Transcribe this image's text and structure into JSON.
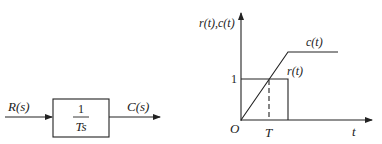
{
  "block_diagram": {
    "input_label": "R(s)",
    "output_label": "C(s)",
    "transfer_function": {
      "numerator": "1",
      "denominator": "Ts"
    }
  },
  "graph": {
    "y_axis_label": "r(t),c(t)",
    "x_axis_label": "t",
    "origin_label": "O",
    "y_tick_label": "1",
    "x_tick_label": "T",
    "curves": [
      {
        "name": "c(t)",
        "label": "c(t)",
        "description": "ramp from origin rising through (T,1) then flattening"
      },
      {
        "name": "r(t)",
        "label": "r(t)",
        "description": "rectangular pulse of height 1"
      }
    ]
  },
  "colors": {
    "line": "#222222",
    "background": "#ffffff"
  }
}
